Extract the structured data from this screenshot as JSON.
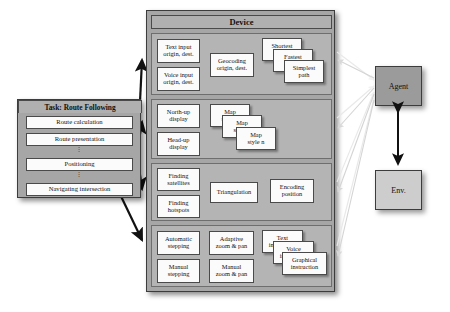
{
  "diagram": {
    "colors": {
      "panel_gray": "#a6a6a6",
      "section_gray": "#b4b4b4",
      "box_white": "#fbfbfb",
      "agent_gray": "#9b9b9b",
      "env_gray": "#cdcdcd",
      "border_dark": "#3c3c3c"
    }
  },
  "task": {
    "title": "Task: Route Following",
    "items": [
      {
        "label": "Route calculation"
      },
      {
        "label": "Route presentation"
      },
      {
        "label": "Positioning"
      },
      {
        "label": "Navigating intersection"
      }
    ],
    "ellipsis": ":"
  },
  "device": {
    "title": "Device",
    "sections": [
      {
        "name": "route-calculation-section",
        "left_column": [
          {
            "label": "Text input\norigin, dest."
          },
          {
            "label": "Voice input\norigin, dest."
          }
        ],
        "middle": [
          {
            "label": "Geocoding\norigin, dest."
          }
        ],
        "stack": [
          {
            "label": "Shortest\npath"
          },
          {
            "label": "Fastest\npath"
          },
          {
            "label": "Simplest\npath"
          }
        ]
      },
      {
        "name": "route-presentation-section",
        "left_column": [
          {
            "label": "North-up\ndisplay"
          },
          {
            "label": "Head-up\ndisplay"
          }
        ],
        "middle": [],
        "stack": [
          {
            "label": "Map\nstyle 1"
          },
          {
            "label": "Map\nstyle 2"
          },
          {
            "label": "Map\nstyle n"
          }
        ]
      },
      {
        "name": "positioning-section",
        "left_column": [
          {
            "label": "Finding\nsatellites"
          },
          {
            "label": "Finding\nhotspots"
          }
        ],
        "middle": [
          {
            "label": "Triangulation"
          },
          {
            "label": "Encoding\nposition"
          }
        ],
        "stack": []
      },
      {
        "name": "navigating-intersection-section",
        "left_column": [
          {
            "label": "Automatic\nstepping"
          },
          {
            "label": "Manual\nstepping"
          }
        ],
        "middle": [
          {
            "label": "Adaptive\nzoom & pan"
          },
          {
            "label": "Manual\nzoom & pan"
          }
        ],
        "stack": [
          {
            "label": "Text\ninstruction"
          },
          {
            "label": "Voice\ninstruction"
          },
          {
            "label": "Graphical\ninstruction"
          }
        ]
      }
    ]
  },
  "right": {
    "agent": "Agent",
    "env": "Env."
  }
}
